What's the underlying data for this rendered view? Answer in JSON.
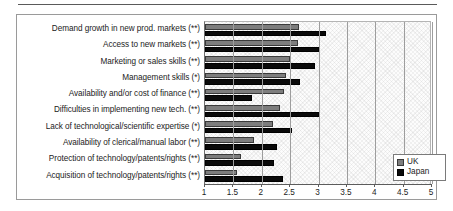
{
  "chart_data": {
    "type": "bar",
    "orientation": "horizontal",
    "title": "",
    "xlabel": "",
    "ylabel": "",
    "xlim": [
      1,
      5
    ],
    "xticks": [
      "1",
      "1.5",
      "2",
      "2.5",
      "3",
      "3.5",
      "4",
      "4.5",
      "5"
    ],
    "xtick_values": [
      1,
      1.5,
      2,
      2.5,
      3,
      3.5,
      4,
      4.5,
      5
    ],
    "grid": true,
    "grid_axis": "x",
    "legend_position": "bottom-right",
    "categories": [
      "Demand growth in new prod. markets (**)",
      "Access to new markets (**)",
      "Marketing or sales skills (**)",
      "Management skills (*)",
      "Availability and/or cost of finance (**)",
      "Difficulties in implementing new tech. (**)",
      "Lack of technological/scientific expertise (*)",
      "Availability of clerical/manual labor (**)",
      "Protection of technology/patents/rights (**)",
      "Acquisition of technology/patents/rights (**)"
    ],
    "series": [
      {
        "name": "UK",
        "color": "#7d7d7d",
        "values": [
          2.66,
          2.64,
          2.5,
          2.42,
          2.4,
          2.33,
          2.19,
          1.87,
          1.63,
          1.56
        ]
      },
      {
        "name": "Japan",
        "color": "#0a0a0a",
        "values": [
          3.13,
          3.01,
          2.94,
          2.68,
          1.83,
          3.0,
          2.53,
          2.26,
          2.21,
          2.37
        ]
      }
    ]
  },
  "legend": {
    "items": [
      {
        "label": "UK",
        "swatch": "uk"
      },
      {
        "label": "Japan",
        "swatch": "japan"
      }
    ]
  }
}
